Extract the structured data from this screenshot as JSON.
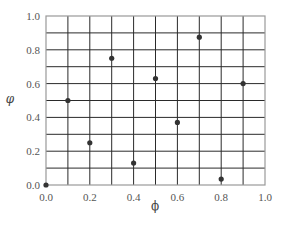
{
  "chart_data": {
    "type": "scatter",
    "title": "",
    "xlabel": "ϕ",
    "ylabel": "φ",
    "xlim": [
      0.0,
      1.0
    ],
    "ylim": [
      0.0,
      1.0
    ],
    "grid": true,
    "grid_step": 0.1,
    "legend": null,
    "x_ticks": [
      "0.0",
      "0.2",
      "0.4",
      "0.6",
      "0.8",
      "1.0"
    ],
    "y_ticks": [
      "0.0",
      "0.2",
      "0.4",
      "0.6",
      "0.8",
      "1.0"
    ],
    "points": [
      {
        "x": 0.0,
        "y": 0.0
      },
      {
        "x": 0.1,
        "y": 0.5
      },
      {
        "x": 0.2,
        "y": 0.25
      },
      {
        "x": 0.3,
        "y": 0.75
      },
      {
        "x": 0.4,
        "y": 0.13
      },
      {
        "x": 0.5,
        "y": 0.63
      },
      {
        "x": 0.6,
        "y": 0.37
      },
      {
        "x": 0.7,
        "y": 0.875
      },
      {
        "x": 0.8,
        "y": 0.035
      },
      {
        "x": 0.9,
        "y": 0.6
      }
    ],
    "colors": {
      "point": "#333333",
      "grid": "#2a2a2a",
      "frame": "#999999"
    }
  }
}
